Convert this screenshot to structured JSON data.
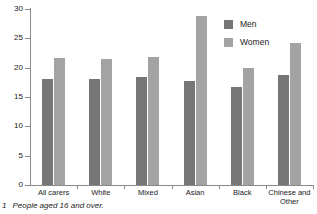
{
  "chart_data": {
    "type": "bar",
    "title": "",
    "xlabel": "",
    "ylabel": "",
    "ylim": [
      0,
      30
    ],
    "yticks": [
      0,
      5,
      10,
      15,
      20,
      25,
      30
    ],
    "grid": false,
    "legend_position": "top-right",
    "categories": [
      "All carers",
      "White",
      "Mixed",
      "Asian",
      "Black",
      "Chinese and\nOther"
    ],
    "series": [
      {
        "name": "Men",
        "color": "#767676",
        "values": [
          18.0,
          18.0,
          18.4,
          17.8,
          16.7,
          18.8
        ]
      },
      {
        "name": "Women",
        "color": "#a3a3a3",
        "values": [
          21.7,
          21.4,
          21.8,
          28.8,
          20.0,
          24.2
        ]
      }
    ]
  },
  "legend": {
    "items": [
      {
        "label": "Men"
      },
      {
        "label": "Women"
      }
    ]
  },
  "footnote": {
    "marker": "1",
    "text": "People aged 16 and over."
  }
}
